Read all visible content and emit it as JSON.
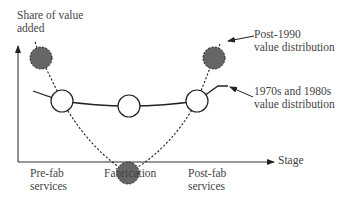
{
  "diagram": {
    "y_axis_label": [
      "Share of value",
      "added"
    ],
    "x_axis_label": "Stage",
    "stages": [
      {
        "label": [
          "Pre-fab",
          "services"
        ]
      },
      {
        "label": [
          "Fabrication"
        ]
      },
      {
        "label": [
          "Post-fab",
          "services"
        ]
      }
    ],
    "series": [
      {
        "name": "Post-1990 value distribution",
        "label": [
          "Post-1990",
          "value distribution"
        ],
        "style": "dashed",
        "marker_fill": "#666666"
      },
      {
        "name": "1970s and 1980s value distribution",
        "label": [
          "1970s and 1980s",
          "value distribution"
        ],
        "style": "solid",
        "marker_fill": "#ffffff"
      }
    ],
    "colors": {
      "line": "#222222",
      "gray_marker": "#666666",
      "text": "#444444"
    }
  }
}
